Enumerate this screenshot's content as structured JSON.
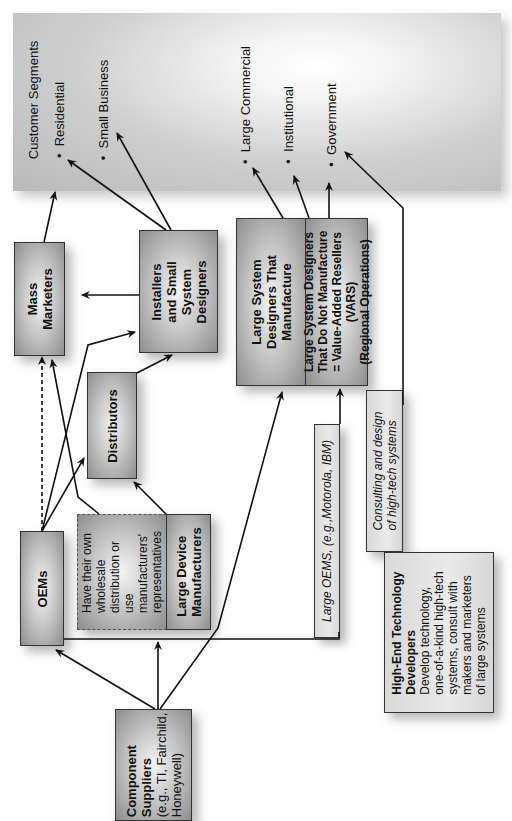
{
  "customer_segments": {
    "title": "Customer Segments",
    "bullet": "•",
    "items": [
      "Residential",
      "Small Business",
      "Large Commercial",
      "Institutional",
      "Government"
    ]
  },
  "boxes": {
    "mass_marketers": "Mass Marketers",
    "installers": [
      "Installers",
      "and Small",
      "System",
      "Designers"
    ],
    "distributors": "Distributors",
    "oems": "OEMs",
    "own_distribution": [
      "Have their own",
      "wholesale",
      "distribution or",
      "use",
      "manufacturers'",
      "representatives"
    ],
    "large_device_manufacturers": [
      "Large Device",
      "Manufacturers"
    ],
    "large_system_manufacture": [
      "Large System",
      "Designers That",
      "Manufacture"
    ],
    "vars": [
      "Large System Designers",
      "That Do Not Manufacture",
      "= Value-Added Resellers",
      "(VARS)",
      "(Regional Operations)"
    ],
    "large_oems": "Large OEMS, (e.g.,Motorola, IBM)",
    "consulting": [
      "Consulting and design",
      "of high-tech systems"
    ],
    "high_end": {
      "title_lines": [
        "High-End Technology",
        "Developers"
      ],
      "desc_lines": [
        "Develop technology,",
        "one-of-a-kind high-tech",
        "systems, consult with",
        "makers and marketers",
        "of large systems"
      ]
    },
    "component_suppliers": {
      "title_lines": [
        "Component",
        "Suppliers"
      ],
      "desc_lines": [
        "(e.g., TI, Fairchild,",
        "Honeywell)"
      ]
    }
  },
  "colors": {
    "arrow": "#111111",
    "box_border": "#333333",
    "background": "#ffffff"
  }
}
